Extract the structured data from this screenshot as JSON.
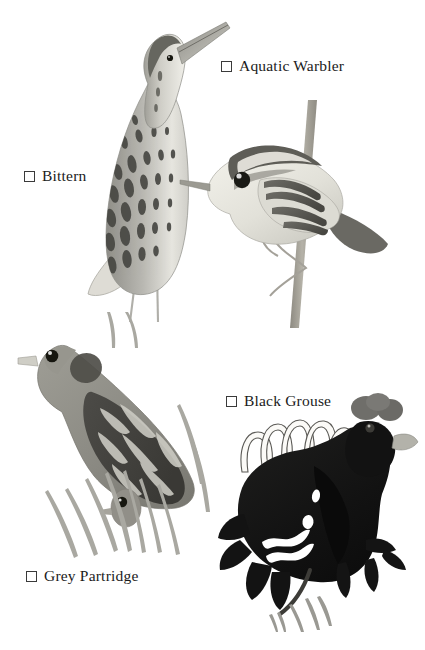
{
  "page": {
    "background_color": "#ffffff",
    "ink_color": "#1b1b1b",
    "width": 425,
    "height": 650
  },
  "checklist": [
    {
      "id": "bittern",
      "label": "Bittern",
      "checked": false,
      "checkbox_glyph": "empty-square",
      "illustration": "bittern-standing-neck-up"
    },
    {
      "id": "aquatic-warbler",
      "label": "Aquatic Warbler",
      "checked": false,
      "checkbox_glyph": "empty-square",
      "illustration": "warbler-perched-on-reed"
    },
    {
      "id": "black-grouse",
      "label": "Black Grouse",
      "checked": false,
      "checkbox_glyph": "empty-square",
      "illustration": "black-grouse-displaying"
    },
    {
      "id": "grey-partridge",
      "label": "Grey Partridge",
      "checked": false,
      "checkbox_glyph": "empty-square",
      "illustration": "grey-partridge-in-grass"
    }
  ],
  "palette": {
    "ink": "#1b1b1b",
    "checkbox_border": "#3a3a3a",
    "bittern_dark": "#4e4e4e",
    "bittern_mid": "#9a9a96",
    "bittern_light": "#e3e2dd",
    "warbler_dark": "#5a5a58",
    "warbler_light": "#ebeae4",
    "reed_stem": "#a8a49a",
    "partridge_body": "#8e8d87",
    "partridge_wing": "#4a4a48",
    "grouse_black": "#151515",
    "grouse_wattle": "#6f6f6d",
    "grass": "#a9a8a2"
  }
}
